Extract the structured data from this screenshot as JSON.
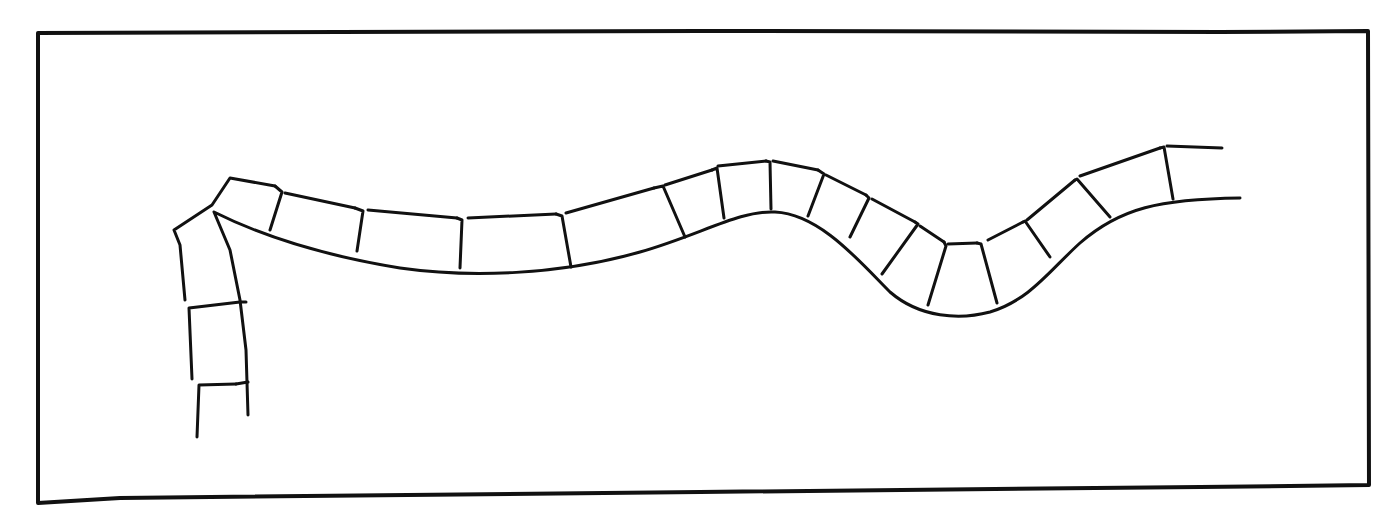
{
  "figure": {
    "ink_color": "#111111",
    "background_color": "#ffffff",
    "frame": {
      "path": "M38,33 L700,31 L1220,32 L1368,31 L1369,485 L1200,487 L700,492 L120,498 L38,503 Z"
    },
    "outer_edge": {
      "path": "M197,437 L199,385 L236,384 M192,379 L189,308 L240,302 M185,300 L180,245 L174,230 L212,205 L230,178 L275,186 M285,193 L355,208 M368,210 L457,218 M468,218 L556,214 M566,213 L654,188 M665,185 L712,170 M718,166 L766,161 M773,161 L818,170 M826,175 L866,195 M872,199 L915,222 M920,226 L944,242 M948,244 L977,243 M988,240 L1023,222 M1027,220 L1075,180 M1080,176 L1160,148 M1167,146 L1222,148"
    },
    "inner_edge": {
      "path": "M248,415 L246,350 L240,300 L230,250 L214,212 C260,235 320,255 400,268 C470,278 560,275 640,252 C700,235 740,210 775,212 C820,214 860,262 890,292 C920,318 960,320 990,312 C1030,300 1050,270 1080,243 C1120,208 1160,199 1240,198"
    },
    "joints": {
      "path": "M236,384 L248,382 M240,302 L246,302 M275,186 L282,192 L270,230 M355,208 L363,211 L357,251 M457,218 L462,220 L460,268 M556,214 L562,216 L571,267 M654,188 L663,186 L685,237 M712,170 L717,168 L724,218 M766,161 L770,162 L771,209 M818,170 L824,174 L808,216 M866,195 L869,198 L850,237 M915,222 L918,224 L882,274 M944,242 L946,246 L928,305 M977,243 L981,244 L997,303 M1023,222 L1025,221 L1050,257 M1075,180 L1077,179 L1110,217 M1160,148 L1164,147 L1173,199"
    }
  }
}
